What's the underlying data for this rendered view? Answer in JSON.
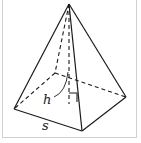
{
  "figure": {
    "type": "square-pyramid",
    "labels": {
      "height": "h",
      "side": "s"
    },
    "colors": {
      "stroke": "#1a1a1a",
      "frame": "#cfcfcf",
      "background": "#ffffff"
    }
  }
}
